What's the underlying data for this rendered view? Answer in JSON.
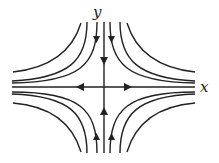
{
  "diagram": {
    "type": "phase-portrait-saddle",
    "axes": {
      "x_label": "x",
      "y_label": "y"
    },
    "center": [
      104,
      87
    ],
    "flow": {
      "y_axis": "inward (toward origin)",
      "x_axis": "outward (away from origin)"
    },
    "colors": {
      "stroke": "#222222",
      "background": "#ffffff"
    }
  }
}
